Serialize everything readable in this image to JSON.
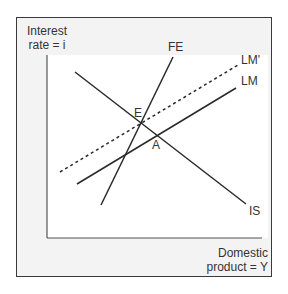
{
  "diagram": {
    "y_axis_label_line1": "Interest",
    "y_axis_label_line2": "rate = i",
    "x_axis_label_line1": "Domestic",
    "x_axis_label_line2": "product = Y",
    "curves": {
      "FE": {
        "label": "FE",
        "style": "solid"
      },
      "LM_prime": {
        "label": "LM'",
        "style": "dashed"
      },
      "LM": {
        "label": "LM",
        "style": "solid"
      },
      "IS": {
        "label": "IS",
        "style": "solid"
      }
    },
    "points": {
      "E": {
        "label": "E"
      },
      "A": {
        "label": "A"
      }
    },
    "colors": {
      "line": "#2a2a2a",
      "frame_bg": "#f3f3f3",
      "plot_bg": "#ffffff"
    }
  }
}
